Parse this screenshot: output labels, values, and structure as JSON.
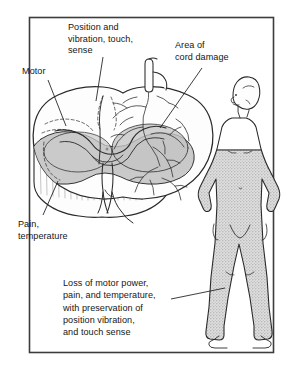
{
  "figure": {
    "frame_color": "#3c3c3c",
    "background_color": "#ffffff",
    "ink_color": "#2a2a2a",
    "damage_shade_color": "#c8c8c8",
    "body_shade_color": "#b9b9b9"
  },
  "labels": {
    "position": "Position and\nvibration, touch,\nsense",
    "area_of_damage": "Area of\ncord damage",
    "motor": "Motor",
    "pain": "Pain,\ntemperature",
    "caption": "Loss of motor power,\npain, and temperature,\nwith preservation of\nposition vibration,\nand touch sense"
  }
}
